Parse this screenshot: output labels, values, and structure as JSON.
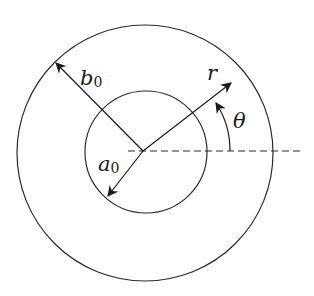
{
  "diagram": {
    "center": {
      "x": 143,
      "y": 151
    },
    "outer_circle": {
      "label": "b",
      "subscript": "0",
      "radius": 128
    },
    "inner_circle": {
      "label": "a",
      "subscript": "0",
      "radius": 61
    },
    "radial_coordinate": {
      "label": "r"
    },
    "angle": {
      "label": "θ"
    },
    "reference_axis": {
      "style": "dashed",
      "direction": "horizontal"
    },
    "colors": {
      "stroke": "#2a2a2a",
      "background": "#ffffff"
    }
  },
  "labels": {
    "b0_main": "b",
    "b0_sub": "0",
    "a0_main": "a",
    "a0_sub": "0",
    "r": "r",
    "theta": "θ"
  }
}
